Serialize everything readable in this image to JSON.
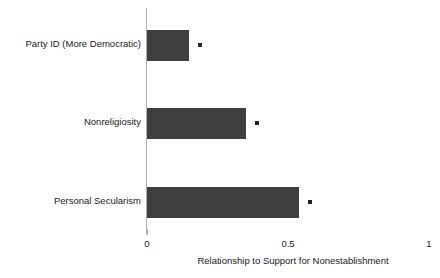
{
  "chart_data": {
    "type": "bar",
    "orientation": "horizontal",
    "title": "",
    "subtitle": "",
    "xlabel": "Relationship to Support for Nonestablishment",
    "ylabel": "",
    "xlim": [
      0,
      1
    ],
    "xticks": [
      "0",
      "0.5",
      "1"
    ],
    "xtick_values": [
      0,
      0.5,
      1
    ],
    "grid": false,
    "legend": null,
    "bar_color": "#3f3f3f",
    "axis_color": "#b0b0b0",
    "marker_color": "#222222",
    "marker_note": "significance marker dot at end of each bar",
    "categories": [
      "Party ID (More Democratic)",
      "Nonreligiosity",
      "Personal Secularism"
    ],
    "values": [
      0.15,
      0.35,
      0.54
    ],
    "bars": [
      {
        "label": "Party ID (More Democratic)",
        "value": 0.15,
        "marker": true
      },
      {
        "label": "Nonreligiosity",
        "value": 0.35,
        "marker": true
      },
      {
        "label": "Personal Secularism",
        "value": 0.54,
        "marker": true
      }
    ]
  }
}
